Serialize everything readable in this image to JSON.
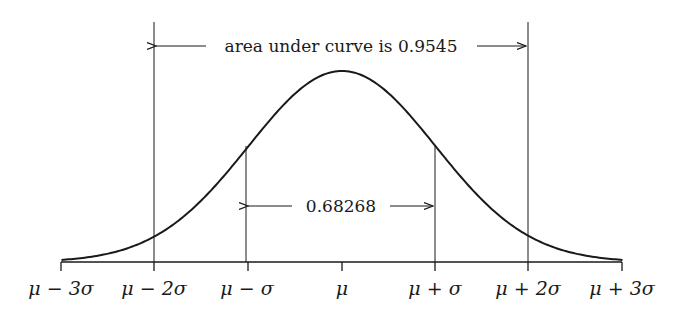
{
  "chart_data": {
    "type": "line",
    "title": "",
    "xlabel": "",
    "ylabel": "",
    "x_ticks": [
      "μ − 3σ",
      "μ − 2σ",
      "μ − σ",
      "μ",
      "μ + σ",
      "μ + 2σ",
      "μ + 3σ"
    ],
    "x_range_sigma": [
      -3,
      3
    ],
    "grid": false,
    "legend": null,
    "annotations": [
      {
        "text": "area under curve is 0.9545",
        "span_sigma": [
          -2,
          2
        ]
      },
      {
        "text": "0.68268",
        "span_sigma": [
          -1,
          1
        ]
      }
    ]
  },
  "labels": {
    "outer_annotation": "area under curve is 0.9545",
    "inner_annotation": "0.68268",
    "ticks": {
      "m3": "μ − 3σ",
      "m2": "μ − 2σ",
      "m1": "μ − σ",
      "mu": "μ",
      "p1": "μ + σ",
      "p2": "μ + 2σ",
      "p3": "μ + 3σ"
    }
  },
  "colors": {
    "ink": "#1a1a1a",
    "background": "#ffffff"
  }
}
